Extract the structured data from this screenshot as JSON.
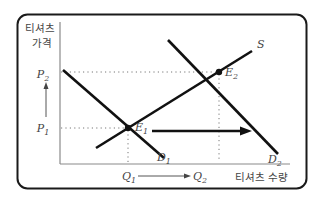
{
  "diagram": {
    "y_axis_label_line1": "티셔츠",
    "y_axis_label_line2": "가격",
    "x_axis_label": "티셔츠 수량",
    "price_labels": {
      "p2": {
        "letter": "P",
        "sub": "2"
      },
      "p1": {
        "letter": "P",
        "sub": "1"
      }
    },
    "quantity_labels": {
      "q1": {
        "letter": "Q",
        "sub": "1"
      },
      "q2": {
        "letter": "Q",
        "sub": "2"
      }
    },
    "curves": {
      "supply": {
        "letter": "S",
        "sub": ""
      },
      "demand1": {
        "letter": "D",
        "sub": "1"
      },
      "demand2": {
        "letter": "D",
        "sub": "2"
      }
    },
    "equilibria": {
      "e1": {
        "letter": "E",
        "sub": "1"
      },
      "e2": {
        "letter": "E",
        "sub": "2"
      }
    },
    "colors": {
      "frame": "#1a1a1a",
      "axis": "#8a8a8a",
      "curve": "#111111",
      "guide": "#777777",
      "text": "#444444"
    }
  }
}
